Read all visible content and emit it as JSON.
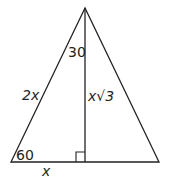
{
  "diagram": {
    "type": "triangle-altitude",
    "stroke_color": "#222222",
    "vertices": {
      "apex": [
        85,
        8
      ],
      "bottom_left": [
        11,
        162
      ],
      "bottom_right": [
        159,
        162
      ],
      "altitude_foot": [
        85,
        162
      ]
    },
    "labels": {
      "top_angle": "30",
      "bottom_left_angle": "60",
      "hypotenuse": "2x",
      "altitude": "x√3",
      "base_segment": "x"
    },
    "right_angle_marker": true
  }
}
